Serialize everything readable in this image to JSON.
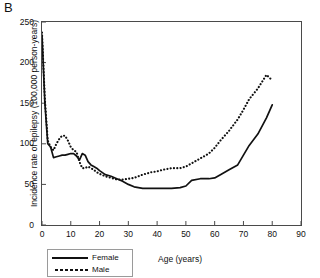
{
  "panel": {
    "letter": "B"
  },
  "chart_data": {
    "type": "line",
    "title": "",
    "xlabel": "Age (years)",
    "ylabel": "Incidence rate of epilepsy (100,000 person-years)",
    "xlim": [
      0,
      90
    ],
    "ylim": [
      0,
      250
    ],
    "xticks": [
      0,
      10,
      20,
      30,
      40,
      50,
      60,
      70,
      80,
      90
    ],
    "yticks": [
      0,
      50,
      100,
      150,
      200,
      250
    ],
    "grid": false,
    "legend_position": "bottom-left",
    "series": [
      {
        "name": "Female",
        "style": "solid",
        "color": "#111111",
        "x": [
          0,
          1,
          2,
          3,
          4,
          5,
          6,
          7,
          8,
          9,
          10,
          11,
          12,
          13,
          14,
          15,
          16,
          17,
          18,
          19,
          20,
          22,
          24,
          26,
          28,
          30,
          32,
          35,
          38,
          40,
          42,
          45,
          48,
          50,
          52,
          55,
          58,
          60,
          62,
          65,
          68,
          70,
          72,
          75,
          78,
          80
        ],
        "values": [
          234,
          150,
          100,
          96,
          83,
          84,
          85,
          86,
          86,
          87,
          88,
          88,
          85,
          80,
          88,
          86,
          78,
          74,
          72,
          70,
          67,
          62,
          60,
          57,
          54,
          50,
          47,
          45,
          45,
          45,
          45,
          45,
          46,
          48,
          55,
          57,
          57,
          58,
          62,
          68,
          74,
          86,
          98,
          112,
          132,
          148
        ]
      },
      {
        "name": "Male",
        "style": "dotted",
        "color": "#111111",
        "x": [
          0,
          1,
          2,
          3,
          4,
          5,
          6,
          7,
          8,
          9,
          10,
          11,
          12,
          13,
          14,
          15,
          16,
          17,
          18,
          19,
          20,
          22,
          24,
          26,
          28,
          30,
          32,
          35,
          38,
          40,
          42,
          45,
          48,
          50,
          52,
          55,
          58,
          60,
          62,
          65,
          68,
          70,
          72,
          75,
          78,
          80
        ],
        "values": [
          237,
          155,
          104,
          96,
          92,
          100,
          106,
          110,
          110,
          104,
          96,
          92,
          90,
          78,
          70,
          70,
          72,
          70,
          68,
          65,
          63,
          60,
          58,
          56,
          56,
          57,
          58,
          62,
          65,
          66,
          68,
          70,
          70,
          72,
          76,
          82,
          88,
          95,
          104,
          116,
          130,
          142,
          155,
          168,
          185,
          178
        ]
      }
    ]
  },
  "legend": {
    "items": [
      {
        "label": "Female",
        "style": "solid"
      },
      {
        "label": "Male",
        "style": "dotted"
      }
    ]
  }
}
